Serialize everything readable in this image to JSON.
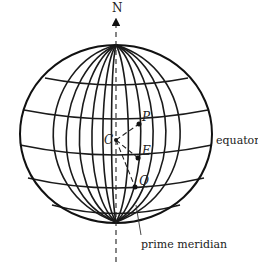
{
  "labels": {
    "north": "N",
    "center": "C",
    "point_p": "P",
    "point_e": "E",
    "point_q": "Q",
    "equator": "equator",
    "prime_meridian": "prime meridian"
  },
  "geometry": {
    "globe": {
      "cx": 116,
      "cy": 134,
      "rx": 96,
      "ry": 89
    },
    "points": {
      "C": {
        "x": 116,
        "y": 140
      },
      "P": {
        "x": 139,
        "y": 124
      },
      "E": {
        "x": 138,
        "y": 158
      },
      "Q": {
        "x": 135,
        "y": 187
      }
    }
  },
  "colors": {
    "line": "#111111",
    "background": "#ffffff"
  }
}
